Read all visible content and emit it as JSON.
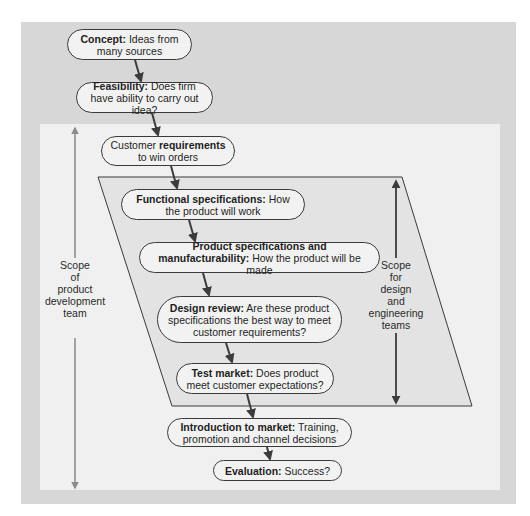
{
  "diagram": {
    "colors": {
      "outer_background": "#d7d7d7",
      "inner_background": "#f0f0f0",
      "parallelogram_fill": "#e3e3e3",
      "node_fill": "#f2f2f2",
      "node_border": "#3a3a3a",
      "arrow_dark": "#3c3c3c",
      "arrow_gray": "#8a8a8a"
    },
    "nodes": [
      {
        "id": "concept",
        "bold": "Concept:",
        "text": " Ideas from many sources"
      },
      {
        "id": "feasibility",
        "bold": "Feasibility:",
        "text": " Does firm have ability to carry out idea?"
      },
      {
        "id": "customer-requirements",
        "pre": "Customer ",
        "bold": "requirements",
        "text": " to win orders"
      },
      {
        "id": "functional-specifications",
        "bold": "Functional specifications:",
        "text": " How the product will work"
      },
      {
        "id": "product-specifications",
        "bold": "Product specifications and manufacturability:",
        "text": " How the product will be made"
      },
      {
        "id": "design-review",
        "bold": "Design review:",
        "text": " Are these product specifications the best way to meet customer requirements?"
      },
      {
        "id": "test-market",
        "bold": "Test market:",
        "text": " Does product meet customer expectations?"
      },
      {
        "id": "introduction-to-market",
        "bold": "Introduction to market:",
        "text": " Training, promotion and channel decisions"
      },
      {
        "id": "evaluation",
        "bold": "Evaluation:",
        "text": " Success?"
      }
    ],
    "scope_labels": {
      "product_development": [
        "Scope",
        "of",
        "product",
        "development",
        "team"
      ],
      "design_engineering": [
        "Scope",
        "for",
        "design",
        "and",
        "engineering",
        "teams"
      ]
    }
  }
}
